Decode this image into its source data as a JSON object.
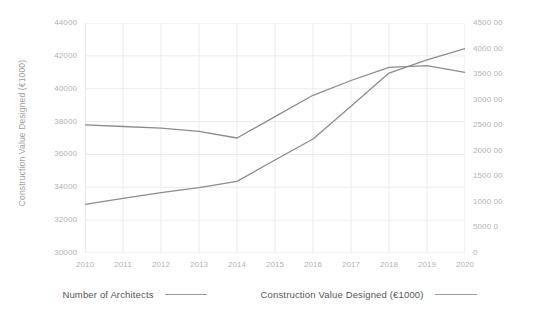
{
  "chart_data": {
    "type": "line",
    "title": "",
    "xlabel": "",
    "ylabel": "Construction Value Designed (€1000)",
    "y2label": "Number of Architects",
    "categories": [
      "2010",
      "2011",
      "2012",
      "2013",
      "2014",
      "2015",
      "2016",
      "2017",
      "2018",
      "2019",
      "2020"
    ],
    "x": [
      2010,
      2011,
      2012,
      2013,
      2014,
      2015,
      2016,
      2017,
      2018,
      2019,
      2020
    ],
    "ylim": [
      30000,
      44000
    ],
    "y2lim": [
      0,
      4500
    ],
    "grid": true,
    "legend_position": "bottom",
    "series": [
      {
        "name": "Construction Value Designed (€1000)",
        "axis": "left",
        "color": "#8c8c8c",
        "values": [
          37800,
          37700,
          37600,
          37400,
          37000,
          38300,
          39600,
          40500,
          41300,
          41400,
          41000
        ]
      },
      {
        "name": "Number of Architects",
        "axis": "right",
        "color": "#8c8c8c",
        "values": [
          950,
          1070,
          1180,
          1280,
          1400,
          1820,
          2230,
          2870,
          3520,
          3780,
          4000
        ]
      }
    ],
    "y_ticks": [
      {
        "value": 30000,
        "label": "30000"
      },
      {
        "value": 32000,
        "label": "32000"
      },
      {
        "value": 34000,
        "label": "34000"
      },
      {
        "value": 36000,
        "label": "36000"
      },
      {
        "value": 38000,
        "label": "38000"
      },
      {
        "value": 40000,
        "label": "40000"
      },
      {
        "value": 42000,
        "label": "42000"
      },
      {
        "value": 44000,
        "label": "44000"
      }
    ],
    "y2_ticks": [
      {
        "value": 0,
        "label": "0"
      },
      {
        "value": 500,
        "label": "5000 0"
      },
      {
        "value": 1000,
        "label": "1000 00"
      },
      {
        "value": 1500,
        "label": "1500 00"
      },
      {
        "value": 2000,
        "label": "2000 00"
      },
      {
        "value": 2500,
        "label": "2500 00"
      },
      {
        "value": 3000,
        "label": "3000 00"
      },
      {
        "value": 3500,
        "label": "3500 00"
      },
      {
        "value": 4000,
        "label": "4000 00"
      },
      {
        "value": 4500,
        "label": "4500 00"
      }
    ],
    "legend": [
      {
        "label": "Number of Architects",
        "color": "#9a9a9a"
      },
      {
        "label": "Construction Value Designed (€1000)",
        "color": "#9a9a9a"
      }
    ]
  },
  "style": {
    "background": "#ffffff",
    "grid_color": "#ebebeb",
    "axis_label_color": "#b3b3b3",
    "axis_title_color": "#a0a0a0",
    "legend_text_color": "#555555",
    "line_color": "#8c8c8c"
  }
}
